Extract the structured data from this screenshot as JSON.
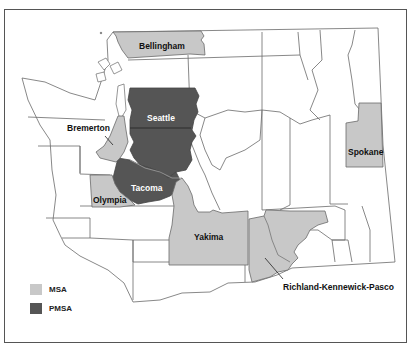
{
  "map": {
    "region": "Washington State",
    "colors": {
      "msa": "#c8c8c8",
      "pmsa": "#555555",
      "county_border": "#6a6a6a",
      "background": "#ffffff",
      "frame": "#555555"
    },
    "labels": {
      "bellingham": "Bellingham",
      "seattle": "Seattle",
      "bremerton": "Bremerton",
      "tacoma": "Tacoma",
      "olympia": "Olympia",
      "spokane": "Spokane",
      "yakima": "Yakima",
      "richland": "Richland-Kennewick-Pasco"
    },
    "areas": [
      {
        "name": "Bellingham",
        "type": "MSA"
      },
      {
        "name": "Bremerton",
        "type": "MSA"
      },
      {
        "name": "Olympia",
        "type": "MSA"
      },
      {
        "name": "Spokane",
        "type": "MSA"
      },
      {
        "name": "Yakima",
        "type": "MSA"
      },
      {
        "name": "Richland-Kennewick-Pasco",
        "type": "MSA"
      },
      {
        "name": "Seattle",
        "type": "PMSA"
      },
      {
        "name": "Tacoma",
        "type": "PMSA"
      }
    ]
  },
  "legend": {
    "items": [
      {
        "label": "MSA",
        "color": "#c8c8c8"
      },
      {
        "label": "PMSA",
        "color": "#555555"
      }
    ]
  }
}
